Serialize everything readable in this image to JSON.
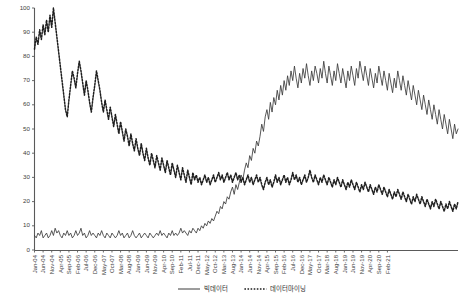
{
  "chart_data": {
    "type": "line",
    "title": "",
    "subtitle": "",
    "xlabel": "",
    "ylabel": "",
    "ylim": [
      0,
      100
    ],
    "yticks": [
      0,
      10,
      20,
      30,
      40,
      50,
      60,
      70,
      80,
      90,
      100
    ],
    "grid": false,
    "legend_position": "bottom",
    "x_tick_step_months": 5,
    "x_start": "Jan-04",
    "x_end": "Feb-21",
    "xticks": [
      "Jan-04",
      "Jun-04",
      "Nov-04",
      "Apr-05",
      "Sep-05",
      "Feb-06",
      "Jul-06",
      "Dec-06",
      "May-07",
      "Oct-07",
      "Mar-08",
      "Aug-08",
      "Jan-09",
      "Jun-09",
      "Nov-09",
      "Apr-10",
      "Sep-10",
      "Feb-11",
      "Jul-11",
      "Dec-11",
      "May-12",
      "Oct-12",
      "Mar-13",
      "Aug-13",
      "Jan-14",
      "Jun-14",
      "Nov-14",
      "Apr-15",
      "Sep-15",
      "Feb-16",
      "Jul-16",
      "Dec-16",
      "May-17",
      "Oct-17",
      "Mar-18",
      "Aug-18",
      "Jan-19",
      "Jun-19",
      "Nov-19",
      "Apr-20",
      "Sep-20",
      "Feb-21"
    ],
    "series": [
      {
        "name": "빅데이터",
        "style": "solid",
        "color": "#3a3a3a",
        "values": [
          6,
          5,
          7,
          6,
          8,
          5,
          6,
          7,
          5,
          6,
          8,
          6,
          9,
          7,
          8,
          6,
          5,
          7,
          6,
          8,
          6,
          7,
          5,
          6,
          8,
          6,
          7,
          9,
          6,
          7,
          5,
          6,
          8,
          6,
          7,
          6,
          5,
          7,
          6,
          8,
          6,
          5,
          7,
          6,
          5,
          7,
          6,
          5,
          6,
          8,
          6,
          7,
          5,
          6,
          7,
          5,
          6,
          8,
          6,
          5,
          6,
          7,
          5,
          6,
          7,
          6,
          5,
          7,
          6,
          5,
          6,
          7,
          6,
          8,
          6,
          7,
          6,
          5,
          7,
          6,
          8,
          6,
          7,
          6,
          7,
          9,
          7,
          8,
          7,
          6,
          8,
          7,
          9,
          8,
          7,
          9,
          8,
          10,
          9,
          11,
          10,
          12,
          11,
          13,
          12,
          14,
          16,
          15,
          18,
          17,
          20,
          19,
          22,
          21,
          24,
          26,
          23,
          27,
          25,
          28,
          31,
          29,
          33,
          36,
          34,
          39,
          37,
          42,
          40,
          45,
          43,
          47,
          52,
          49,
          55,
          58,
          54,
          61,
          57,
          63,
          60,
          66,
          62,
          68,
          64,
          70,
          66,
          72,
          68,
          74,
          70,
          76,
          71,
          67,
          73,
          69,
          75,
          71,
          77,
          72,
          68,
          74,
          70,
          76,
          73,
          69,
          75,
          71,
          78,
          73,
          69,
          76,
          72,
          68,
          74,
          70,
          77,
          73,
          69,
          75,
          71,
          67,
          74,
          70,
          76,
          72,
          68,
          75,
          71,
          78,
          74,
          70,
          76,
          72,
          68,
          75,
          71,
          67,
          73,
          69,
          76,
          72,
          68,
          74,
          70,
          66,
          73,
          69,
          65,
          71,
          67,
          74,
          70,
          66,
          72,
          68,
          64,
          70,
          66,
          62,
          68,
          64,
          60,
          66,
          62,
          58,
          64,
          60,
          56,
          62,
          58,
          54,
          60,
          56,
          52,
          58,
          54,
          50,
          56,
          52,
          48,
          54,
          50,
          46,
          52,
          48,
          50
        ]
      },
      {
        "name": "데이터마이닝",
        "style": "dashed",
        "color": "#1f1f1f",
        "values": [
          83,
          88,
          85,
          91,
          87,
          93,
          89,
          95,
          90,
          97,
          92,
          100,
          94,
          88,
          82,
          76,
          70,
          64,
          58,
          55,
          62,
          68,
          74,
          71,
          67,
          73,
          78,
          74,
          69,
          64,
          70,
          66,
          61,
          57,
          63,
          68,
          74,
          70,
          66,
          61,
          57,
          62,
          58,
          54,
          59,
          55,
          51,
          56,
          52,
          48,
          53,
          49,
          45,
          50,
          47,
          43,
          48,
          44,
          41,
          46,
          42,
          39,
          44,
          40,
          37,
          42,
          38,
          35,
          40,
          37,
          34,
          39,
          36,
          33,
          38,
          35,
          32,
          37,
          34,
          31,
          36,
          33,
          30,
          35,
          32,
          29,
          34,
          31,
          28,
          33,
          30,
          27,
          32,
          29,
          31,
          28,
          30,
          27,
          29,
          31,
          28,
          30,
          27,
          29,
          31,
          28,
          30,
          32,
          29,
          31,
          28,
          30,
          32,
          29,
          31,
          28,
          30,
          32,
          29,
          31,
          28,
          30,
          27,
          29,
          31,
          28,
          30,
          27,
          29,
          31,
          28,
          30,
          27,
          25,
          28,
          30,
          27,
          29,
          26,
          28,
          31,
          28,
          30,
          27,
          29,
          31,
          28,
          30,
          27,
          29,
          32,
          29,
          31,
          28,
          30,
          27,
          29,
          31,
          28,
          30,
          33,
          30,
          28,
          31,
          29,
          27,
          30,
          28,
          31,
          29,
          27,
          30,
          28,
          26,
          29,
          27,
          30,
          28,
          26,
          29,
          27,
          25,
          28,
          26,
          29,
          27,
          25,
          28,
          26,
          24,
          27,
          25,
          28,
          26,
          24,
          27,
          25,
          23,
          26,
          24,
          27,
          25,
          23,
          26,
          24,
          22,
          25,
          23,
          21,
          24,
          22,
          25,
          23,
          21,
          24,
          22,
          20,
          23,
          21,
          19,
          22,
          20,
          23,
          21,
          19,
          22,
          20,
          18,
          21,
          19,
          17,
          20,
          18,
          21,
          19,
          17,
          20,
          18,
          16,
          19,
          17,
          20,
          18,
          16,
          19,
          17,
          20
        ]
      }
    ]
  },
  "legend": {
    "items": [
      {
        "label": "빅데이터"
      },
      {
        "label": "데이터마이닝"
      }
    ]
  }
}
